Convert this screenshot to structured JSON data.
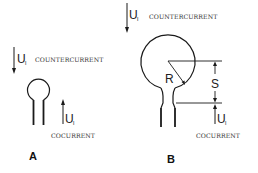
{
  "figure": {
    "panels": [
      {
        "id": "A",
        "label": "A",
        "countercurrent": {
          "symbol": "U",
          "subscript": "l",
          "text": "COUNTERCURRENT"
        },
        "cocurrent": {
          "symbol": "U",
          "subscript": "l",
          "text": "COCURRENT"
        }
      },
      {
        "id": "B",
        "label": "B",
        "countercurrent": {
          "symbol": "U",
          "subscript": "l",
          "text": "COUNTERCURRENT"
        },
        "cocurrent": {
          "symbol": "U",
          "subscript": "l",
          "text": "COCURRENT"
        },
        "dimensions": {
          "radius": "R",
          "spacing": "S"
        }
      }
    ],
    "colors": {
      "stroke": "#1a1a1a",
      "text": "#222222",
      "background": "#ffffff"
    }
  }
}
